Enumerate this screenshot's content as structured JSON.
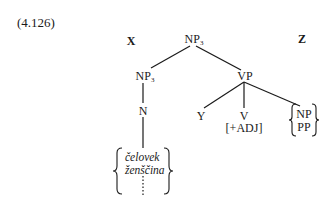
{
  "example_number": "(4.126)",
  "tree": {
    "root": {
      "label": "NP",
      "subscript": "3"
    },
    "left_context": "X",
    "right_context": "Z",
    "np_left": {
      "label": "NP",
      "subscript": "3"
    },
    "vp": {
      "label": "VP"
    },
    "n": {
      "label": "N"
    },
    "y": {
      "label": "Y"
    },
    "v": {
      "label": "V",
      "feature": "[+ADJ]"
    },
    "vp_right_options": [
      "NP",
      "PP"
    ],
    "noun_options": [
      "čelovek",
      "ženščina"
    ],
    "noun_options_continuation": "⋮"
  }
}
